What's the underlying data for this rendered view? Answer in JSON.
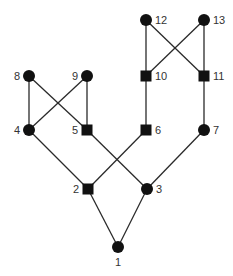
{
  "diagram": {
    "type": "lattice-graph",
    "nodes": [
      {
        "id": "1",
        "label": "1",
        "shape": "circle",
        "x": 118,
        "y": 247,
        "label_pos": "below"
      },
      {
        "id": "2",
        "label": "2",
        "shape": "square",
        "x": 88,
        "y": 189,
        "label_pos": "left"
      },
      {
        "id": "3",
        "label": "3",
        "shape": "circle",
        "x": 147,
        "y": 189,
        "label_pos": "right"
      },
      {
        "id": "4",
        "label": "4",
        "shape": "circle",
        "x": 29,
        "y": 130,
        "label_pos": "left"
      },
      {
        "id": "5",
        "label": "5",
        "shape": "square",
        "x": 87,
        "y": 130,
        "label_pos": "left"
      },
      {
        "id": "6",
        "label": "6",
        "shape": "square",
        "x": 146,
        "y": 130,
        "label_pos": "right"
      },
      {
        "id": "7",
        "label": "7",
        "shape": "circle",
        "x": 204,
        "y": 130,
        "label_pos": "right"
      },
      {
        "id": "8",
        "label": "8",
        "shape": "circle",
        "x": 29,
        "y": 76,
        "label_pos": "left"
      },
      {
        "id": "9",
        "label": "9",
        "shape": "circle",
        "x": 87,
        "y": 76,
        "label_pos": "left"
      },
      {
        "id": "10",
        "label": "10",
        "shape": "square",
        "x": 146,
        "y": 76,
        "label_pos": "right"
      },
      {
        "id": "11",
        "label": "11",
        "shape": "square",
        "x": 204,
        "y": 76,
        "label_pos": "right"
      },
      {
        "id": "12",
        "label": "12",
        "shape": "circle",
        "x": 146,
        "y": 20,
        "label_pos": "right"
      },
      {
        "id": "13",
        "label": "13",
        "shape": "circle",
        "x": 204,
        "y": 20,
        "label_pos": "right"
      }
    ],
    "edges": [
      [
        "12",
        "10"
      ],
      [
        "12",
        "11"
      ],
      [
        "13",
        "10"
      ],
      [
        "13",
        "11"
      ],
      [
        "8",
        "4"
      ],
      [
        "8",
        "5"
      ],
      [
        "9",
        "4"
      ],
      [
        "9",
        "5"
      ],
      [
        "10",
        "6"
      ],
      [
        "11",
        "7"
      ],
      [
        "4",
        "2"
      ],
      [
        "5",
        "3"
      ],
      [
        "6",
        "2"
      ],
      [
        "7",
        "3"
      ],
      [
        "2",
        "1"
      ],
      [
        "3",
        "1"
      ]
    ],
    "colors": {
      "node": "#111111",
      "edge": "#2a2a2a",
      "label": "#333333",
      "background": "#ffffff"
    }
  }
}
